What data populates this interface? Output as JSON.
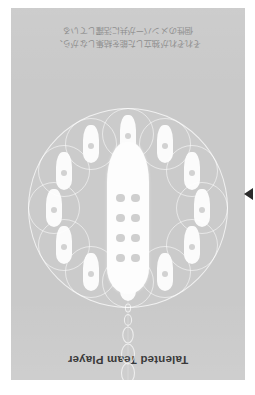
{
  "poster": {
    "title": "Talented Team Player",
    "caption_lines": [
      "それぞれが独立した能を結集しながら、",
      "個性のメンバーが共に活躍している"
    ],
    "orientation": "upside-down",
    "colors": {
      "page_background": "#ffffff",
      "card_background": "#c9c9c9",
      "title_text": "#3a3a3a",
      "caption_text": "#8e8e8e",
      "pin_fill": "#fdfdfd",
      "dot_fill": "#cfcfcf",
      "ring_stroke": "#ffffff",
      "arrow_marker": "#2b2b2b"
    }
  },
  "emblem": {
    "center_pin": {
      "dot_rows": 4,
      "dot_columns": 2,
      "dot_count": 8
    },
    "satellites": [
      {
        "index": 1,
        "angle_deg": 0,
        "dot_count": 1
      },
      {
        "index": 2,
        "angle_deg": 30,
        "dot_count": 1
      },
      {
        "index": 3,
        "angle_deg": 60,
        "dot_count": 1
      },
      {
        "index": 4,
        "angle_deg": 90,
        "dot_count": 1
      },
      {
        "index": 5,
        "angle_deg": 120,
        "dot_count": 1
      },
      {
        "index": 6,
        "angle_deg": 150,
        "dot_count": 1
      },
      {
        "index": 7,
        "angle_deg": 180,
        "dot_count": 1
      },
      {
        "index": 8,
        "angle_deg": 210,
        "dot_count": 1
      },
      {
        "index": 9,
        "angle_deg": 240,
        "dot_count": 1
      },
      {
        "index": 10,
        "angle_deg": 270,
        "dot_count": 1
      },
      {
        "index": 11,
        "angle_deg": 300,
        "dot_count": 1
      },
      {
        "index": 12,
        "angle_deg": 330,
        "dot_count": 1
      }
    ],
    "satellite_count": 12,
    "chain_link_count": 4
  },
  "markers": {
    "edge_arrow_icon": "triangle-left-icon"
  }
}
